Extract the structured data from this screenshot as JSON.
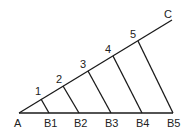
{
  "diagram": {
    "title": "",
    "lines": {
      "base": {
        "from": "A",
        "to": "B5"
      },
      "ray": {
        "from": "A",
        "to": "C"
      }
    },
    "points": {
      "A": {
        "label": "A",
        "x": 19,
        "y": 113
      },
      "C": {
        "label": "C",
        "x": 172,
        "y": 20
      },
      "ray_points": [
        {
          "label": "1",
          "x": 41,
          "y": 99
        },
        {
          "label": "2",
          "x": 63,
          "y": 86
        },
        {
          "label": "3",
          "x": 88,
          "y": 71
        },
        {
          "label": "4",
          "x": 113,
          "y": 56
        },
        {
          "label": "5",
          "x": 138,
          "y": 41
        }
      ],
      "base_points": [
        {
          "label": "B1",
          "x": 49,
          "y": 113
        },
        {
          "label": "B2",
          "x": 79,
          "y": 113
        },
        {
          "label": "B3",
          "x": 111,
          "y": 113
        },
        {
          "label": "B4",
          "x": 142,
          "y": 113
        },
        {
          "label": "B5",
          "x": 173,
          "y": 113
        }
      ]
    },
    "connectors": [
      {
        "from": "1",
        "to": "B1"
      },
      {
        "from": "2",
        "to": "B2"
      },
      {
        "from": "3",
        "to": "B3"
      },
      {
        "from": "4",
        "to": "B4"
      },
      {
        "from": "5",
        "to": "B5"
      }
    ]
  }
}
